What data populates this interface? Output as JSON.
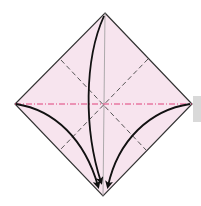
{
  "diagram": {
    "type": "origami-fold-diagram",
    "paper_color": "#f7e4ee",
    "edge_color": "#333333",
    "mountain_fold_color": "#e0407a",
    "valley_fold_color": "#444444",
    "arrow_color": "#111111",
    "tab_color": "#d9d9d9",
    "vertices": {
      "top": [
        105,
        13
      ],
      "left": [
        15,
        104
      ],
      "right": [
        192,
        104
      ],
      "bottom": [
        103,
        196
      ]
    },
    "folds": [
      {
        "kind": "mountain",
        "label": "horizontal diagonal"
      },
      {
        "kind": "crease",
        "label": "vertical diagonal"
      },
      {
        "kind": "valley",
        "label": "upper-left to lower-right"
      },
      {
        "kind": "valley",
        "label": "upper-right to lower-left"
      }
    ],
    "arrows": [
      {
        "from": "top",
        "to": "bottom"
      },
      {
        "from": "left",
        "to": "bottom"
      },
      {
        "from": "right",
        "to": "bottom"
      }
    ]
  }
}
